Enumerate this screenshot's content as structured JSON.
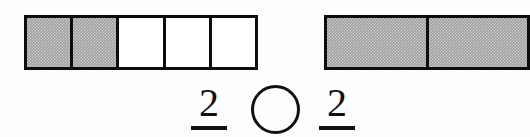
{
  "worksheet": {
    "type": "fraction-comparison",
    "left_model": {
      "name": "five-part-bar",
      "total_parts": 5,
      "shaded_parts": 2,
      "cells": [
        {
          "index": 1,
          "shaded": true
        },
        {
          "index": 2,
          "shaded": true
        },
        {
          "index": 3,
          "shaded": false
        },
        {
          "index": 4,
          "shaded": false
        },
        {
          "index": 5,
          "shaded": false
        }
      ]
    },
    "right_model": {
      "name": "two-part-bar",
      "total_parts": 2,
      "shaded_parts": 2,
      "clipped_at_right_edge": true,
      "cells": [
        {
          "index": 1,
          "shaded": true
        },
        {
          "index": 2,
          "shaded": true
        }
      ]
    },
    "left_fraction": {
      "numerator": "2",
      "denominator": "",
      "denominator_visible": false
    },
    "right_fraction": {
      "numerator": "2",
      "denominator": "",
      "denominator_visible": false
    },
    "comparison_answer": {
      "value": "",
      "shape": "circle"
    },
    "colors": {
      "background": "#fdfdfd",
      "ink": "#0d0d0d",
      "shaded_fill": "#9e9e9e",
      "unshaded_fill": "#ffffff"
    }
  }
}
